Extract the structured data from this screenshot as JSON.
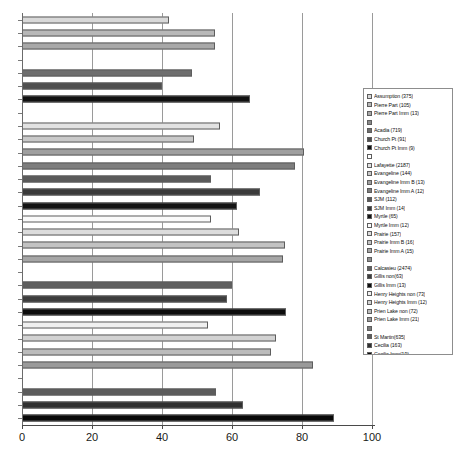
{
  "chart_data": {
    "type": "bar",
    "orientation": "horizontal",
    "title": "",
    "xlabel": "",
    "ylabel": "",
    "xlim": [
      0,
      100
    ],
    "xticks": [
      0,
      20,
      40,
      60,
      80,
      100
    ],
    "xtick_labels": [
      "0",
      "20",
      "40",
      "60",
      "80",
      "100"
    ],
    "grid": true,
    "legend_position": "right",
    "categories": [
      "Assumption (375)",
      "Pierre Part (105)",
      "Pierre Part Imm (13)",
      "",
      "Acadia (719)",
      "Church Pt (91)",
      "Church Pt Imm (9)",
      "",
      "Lafayette (2187)",
      "Evangeline (144)",
      "Evangeline Imm B (13)",
      "Evangeline Imm A (12)",
      "SJM (112)",
      "SJM Imm (14)",
      "Myrtle (65)",
      "Myrtle Imm (12)",
      "Prairie (157)",
      "Prairie Imm B (16)",
      "Prairie Imm A (15)",
      "",
      "Calcasieu (2474)",
      "Gillis non(63)",
      "Gillis Imm (13)",
      "Henry Heights non (73)",
      "Henry Heights Imm (12)",
      "Prien Lake non (72)",
      "Prien Lake Imm (21)",
      "",
      "St Martin(635)",
      "Cecilia (163)",
      "Cecilia Imm(19)"
    ],
    "values": [
      42,
      55,
      55,
      null,
      48.5,
      40,
      65,
      null,
      56.5,
      49,
      80.5,
      78,
      54,
      68,
      61.5,
      54,
      62,
      75,
      74.5,
      null,
      60,
      58.5,
      75.5,
      53,
      72.5,
      71,
      83,
      null,
      55.5,
      63,
      89
    ],
    "colors": [
      "#d9d9d9",
      "#b8b8b8",
      "#a8a8a8",
      "#8a8a8a",
      "#6e6e6e",
      "#4f4f4f",
      "#111111",
      "#ffffff",
      "#e2e2e2",
      "#c9c9c9",
      "#9f9f9f",
      "#7d7d7d",
      "#5a5a5a",
      "#3a3a3a",
      "#141414",
      "#fafafa",
      "#dcdcdc",
      "#c2c2c2",
      "#a6a6a6",
      "#8f8f8f",
      "#5f5f5f",
      "#3d3d3d",
      "#0d0d0d",
      "#f0f0f0",
      "#d2d2d2",
      "#bcbcbc",
      "#9a9a9a",
      "#7b7b7b",
      "#5c5c5c",
      "#303030",
      "#080808"
    ]
  },
  "legend": {
    "items": [
      {
        "label": "Assumption (375)",
        "swatch": "#d9d9d9",
        "spacer": false
      },
      {
        "label": "Pierre Part (105)",
        "swatch": "#b8b8b8",
        "spacer": false
      },
      {
        "label": "Pierre Part Imm (13)",
        "swatch": "#a8a8a8",
        "spacer": false
      },
      {
        "label": "",
        "swatch": "#8a8a8a",
        "spacer": true
      },
      {
        "label": "Acadia (719)",
        "swatch": "#6e6e6e",
        "spacer": false
      },
      {
        "label": "Church Pt (91)",
        "swatch": "#4f4f4f",
        "spacer": false
      },
      {
        "label": "Church Pt Imm (9)",
        "swatch": "#111111",
        "spacer": false
      },
      {
        "label": "",
        "swatch": "#ffffff",
        "spacer": true
      },
      {
        "label": "Lafayette (2187)",
        "swatch": "#e2e2e2",
        "spacer": false
      },
      {
        "label": "Evangeline (144)",
        "swatch": "#c9c9c9",
        "spacer": false
      },
      {
        "label": "Evangeline Imm B (13)",
        "swatch": "#9f9f9f",
        "spacer": false
      },
      {
        "label": "Evangeline Imm A (12)",
        "swatch": "#7d7d7d",
        "spacer": false
      },
      {
        "label": "SJM (112)",
        "swatch": "#5a5a5a",
        "spacer": false
      },
      {
        "label": "SJM Imm (14)",
        "swatch": "#3a3a3a",
        "spacer": false
      },
      {
        "label": "Myrtle (65)",
        "swatch": "#141414",
        "spacer": false
      },
      {
        "label": "Myrtle Imm (12)",
        "swatch": "#fafafa",
        "spacer": false
      },
      {
        "label": "Prairie (157)",
        "swatch": "#dcdcdc",
        "spacer": false
      },
      {
        "label": "Prairie Imm B (16)",
        "swatch": "#c2c2c2",
        "spacer": false
      },
      {
        "label": "Prairie Imm A (15)",
        "swatch": "#a6a6a6",
        "spacer": false
      },
      {
        "label": "",
        "swatch": "#8f8f8f",
        "spacer": true
      },
      {
        "label": "Calcasieu (2474)",
        "swatch": "#5f5f5f",
        "spacer": false
      },
      {
        "label": "Gillis non(63)",
        "swatch": "#3d3d3d",
        "spacer": false
      },
      {
        "label": "Gillis Imm (13)",
        "swatch": "#0d0d0d",
        "spacer": false
      },
      {
        "label": "Henry Heights non (73)",
        "swatch": "#f0f0f0",
        "spacer": false
      },
      {
        "label": "Henry Heights Imm (12)",
        "swatch": "#d2d2d2",
        "spacer": false
      },
      {
        "label": "Prien Lake non (72)",
        "swatch": "#bcbcbc",
        "spacer": false
      },
      {
        "label": "Prien Lake Imm (21)",
        "swatch": "#9a9a9a",
        "spacer": false
      },
      {
        "label": "",
        "swatch": "#7b7b7b",
        "spacer": true
      },
      {
        "label": "St Martin(635)",
        "swatch": "#5c5c5c",
        "spacer": false
      },
      {
        "label": "Cecilia (163)",
        "swatch": "#303030",
        "spacer": false
      },
      {
        "label": "Cecilia Imm(19)",
        "swatch": "#080808",
        "spacer": false
      }
    ]
  },
  "caption": {
    "fragment": ""
  }
}
